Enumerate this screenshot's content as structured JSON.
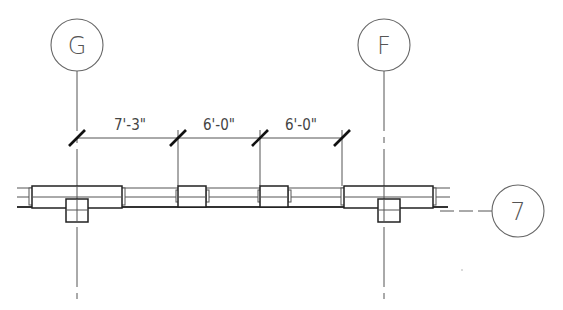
{
  "drawing": {
    "type": "structural plan detail",
    "grid_bubbles": [
      {
        "label": "G",
        "cx": 77,
        "cy": 45
      },
      {
        "label": "F",
        "cx": 384,
        "cy": 45
      },
      {
        "label": "7",
        "cx": 518,
        "cy": 211
      }
    ],
    "dimensions": [
      {
        "label": "7'-3\"",
        "from_x": 77,
        "to_x": 178
      },
      {
        "label": "6'-0\"",
        "from_x": 178,
        "to_x": 260
      },
      {
        "label": "6'-0\"",
        "from_x": 260,
        "to_x": 342
      }
    ],
    "colors": {
      "line": "#555555",
      "heavy": "#111111",
      "background": "#ffffff"
    }
  }
}
